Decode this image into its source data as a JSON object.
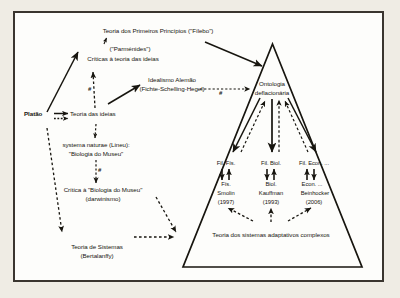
{
  "canvas": {
    "width": 400,
    "height": 298
  },
  "colors": {
    "page_background": "#efece4",
    "frame_background": "#fdfdfb",
    "frame_border": "#3a352f",
    "ink": "#17150f"
  },
  "diagram": {
    "type": "concept-map",
    "left_branch": {
      "nodes": [
        {
          "id": "primeiros-principios",
          "text": "Teoria dos Primeiros Princípios (\"Fílebo\")"
        },
        {
          "id": "parmenides",
          "text": "(\"Parménides\")"
        },
        {
          "id": "criticas-ideias",
          "text": "Críticas à teoria das ideias"
        },
        {
          "id": "idealismo-alemao-l1",
          "text": "Idealismo Alemão"
        },
        {
          "id": "idealismo-alemao-l2",
          "text": "(Fichte-Schelling-Hegel)"
        },
        {
          "id": "platao",
          "text": "Platão"
        },
        {
          "id": "teoria-das-ideias",
          "text": "Teoria das ideias"
        },
        {
          "id": "systema-naturae-l1",
          "text": "systema naturae (Lineu):"
        },
        {
          "id": "systema-naturae-l2",
          "text": "\"Biologia do Museu\""
        },
        {
          "id": "critica-biologia-l1",
          "text": "Crítica à \"Biologia do Museu\""
        },
        {
          "id": "critica-biologia-l2",
          "text": "(darwinismo)"
        },
        {
          "id": "teoria-sistemas-l1",
          "text": "Teoria de Sistemas"
        },
        {
          "id": "teoria-sistemas-l2",
          "text": "(Bertalanffy)"
        }
      ],
      "hash_markers": [
        {
          "id": "hash-criticas",
          "text": "#"
        },
        {
          "id": "hash-systema",
          "text": "#"
        }
      ]
    },
    "triangle": {
      "apex_label_l1": "Ontologia",
      "apex_label_l2": "deflacionária",
      "hash_marker": "#",
      "base_label": "Teoria dos sistemas adaptativos complexos",
      "columns": [
        {
          "id": "fisica",
          "philosophy": "Fil. Fís.",
          "science": "Fís.",
          "author": "Smolin",
          "year": "(1997)"
        },
        {
          "id": "biologia",
          "philosophy": "Fil. Biol.",
          "science": "Biol.",
          "author": "Kauffman",
          "year": "(1993)"
        },
        {
          "id": "economia",
          "philosophy": "Fil. Econ. ...",
          "science": "Econ. ...",
          "author": "Beinhocker",
          "year": "(2006)"
        }
      ]
    }
  }
}
